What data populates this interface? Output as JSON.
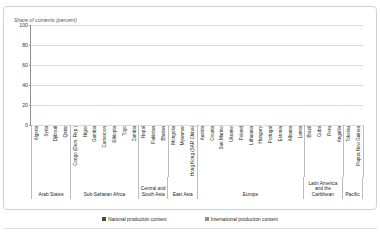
{
  "figure": {
    "top_cut_text": "",
    "axis_title": "Share of contents (percent)"
  },
  "legend": {
    "position": "bottom-center",
    "items": [
      {
        "label": "National production content",
        "color": "#4a4a4a",
        "key": "national"
      },
      {
        "label": "International production content",
        "color": "#8f8f8f",
        "key": "international"
      }
    ]
  },
  "chart_data": {
    "type": "bar",
    "subtype": "stacked-column-100",
    "title": "Share of contents (percent)",
    "xlabel": "",
    "ylabel": "Share of contents (percent)",
    "ylim": [
      0,
      100
    ],
    "yticks": [
      0,
      20,
      40,
      60,
      80,
      100
    ],
    "grid": true,
    "categories": [
      "Algeria",
      "Syria",
      "Djibouti",
      "Qatar",
      "Congo (Dem. Rep.)",
      "Niger",
      "Gambia",
      "Cameroon",
      "Ethiopia",
      "Togo",
      "Zambia",
      "Nepal",
      "Pakistan",
      "Bhutan",
      "Mongolia",
      "Myanmar",
      "Hong Kong (SAR China)",
      "Austria",
      "Croatia",
      "San Marino",
      "Ukraine",
      "Poland",
      "Lithuania",
      "Hungary",
      "Portugal",
      "Estonia",
      "Albania",
      "Latvia",
      "Brazil",
      "Cuba",
      "Peru",
      "Anguilla",
      "Tokelau",
      "Papua New Guinea"
    ],
    "series": [
      {
        "name": "National production content",
        "color": "#4a4a4a",
        "values": [
          100,
          100,
          100,
          100,
          100,
          100,
          100,
          99,
          100,
          100,
          100,
          100,
          100,
          99,
          100,
          100,
          92,
          100,
          100,
          100,
          100,
          88,
          100,
          100,
          100,
          100,
          100,
          100,
          100,
          100,
          100,
          100,
          100,
          93
        ]
      },
      {
        "name": "International production content",
        "color": "#8f8f8f",
        "values": [
          0,
          0,
          0,
          0,
          0,
          0,
          0,
          1,
          0,
          0,
          0,
          0,
          0,
          1,
          0,
          0,
          8,
          0,
          0,
          0,
          0,
          12,
          0,
          0,
          0,
          0,
          0,
          0,
          0,
          0,
          0,
          0,
          0,
          7
        ]
      }
    ],
    "regions": [
      {
        "label": "Arab States",
        "count": 4
      },
      {
        "label": "Sub-Saharan Africa",
        "count": 7
      },
      {
        "label": "Central and South Asia",
        "count": 3
      },
      {
        "label": "East Asia",
        "count": 3
      },
      {
        "label": "Europe",
        "count": 11
      },
      {
        "label": "Latin America and the Caribbean",
        "count": 4
      },
      {
        "label": "Pacific",
        "count": 2
      }
    ]
  }
}
